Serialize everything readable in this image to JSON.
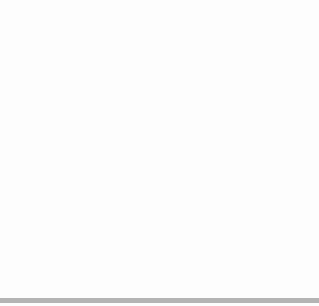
{
  "diagram": {
    "type": "coordinate-grid",
    "grid": {
      "x_min": -10,
      "x_max": 10,
      "y_min": -10,
      "y_max": 10,
      "line_color": "#a8a8a8"
    },
    "axes": {
      "x_label": "x",
      "y_label": "y",
      "color": "#222222"
    },
    "rectangle": {
      "vertices": [
        "A",
        "B",
        "D",
        "E"
      ],
      "color": "#333333"
    },
    "triangle": {
      "vertices": [
        "G",
        "C",
        "F"
      ],
      "color": "#333333"
    },
    "points": [
      {
        "label": "A",
        "x": -2,
        "y": 8
      },
      {
        "label": "B",
        "x": 9,
        "y": 8
      },
      {
        "label": "C",
        "x": 9,
        "y": 2
      },
      {
        "label": "D",
        "x": 9,
        "y": -5
      },
      {
        "label": "E",
        "x": -2,
        "y": -5
      },
      {
        "label": "F",
        "x": -2,
        "y": -2
      },
      {
        "label": "G",
        "x": -2,
        "y": 6
      }
    ]
  },
  "footer_bar_color": "#b4b4b4"
}
